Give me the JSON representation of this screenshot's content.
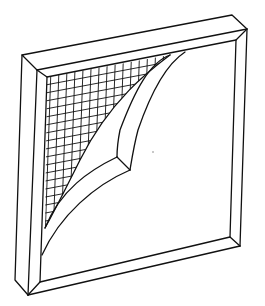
{
  "figure": {
    "colors": {
      "line": "#111111",
      "background": "#ffffff"
    }
  }
}
